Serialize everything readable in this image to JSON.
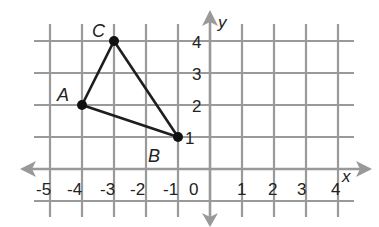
{
  "diagram": {
    "type": "coordinate-plane",
    "axes": {
      "x_label": "x",
      "y_label": "y",
      "x_ticks": [
        "-5",
        "-4",
        "-3",
        "-2",
        "-1",
        "0",
        "1",
        "2",
        "3",
        "4"
      ],
      "y_ticks": [
        "4",
        "3",
        "2",
        "1"
      ]
    },
    "triangle": {
      "vertices": [
        {
          "name": "A",
          "x": -4,
          "y": 2
        },
        {
          "name": "B",
          "x": -1,
          "y": 1
        },
        {
          "name": "C",
          "x": -3,
          "y": 4
        }
      ]
    },
    "colors": {
      "grid": "#9a9a9a",
      "axis": "#999999",
      "triangle": "#1e1e1e",
      "text": "#222222"
    }
  }
}
